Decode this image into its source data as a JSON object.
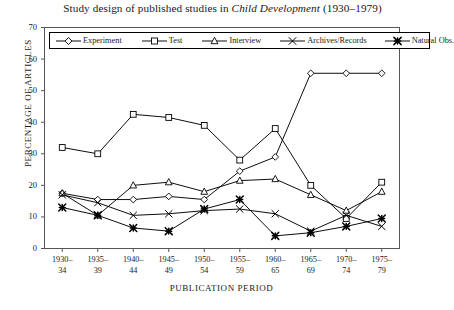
{
  "title": {
    "pre": "Study design of published studies in ",
    "italic": "Child Development",
    "post": " (1930–1979)"
  },
  "axes": {
    "ylabel": "PERCENTAGE OF ARTICLES",
    "xlabel": "PUBLICATION PERIOD",
    "yticks": [
      "0",
      "10",
      "20",
      "30",
      "40",
      "50",
      "60",
      "70"
    ],
    "ymin": 0,
    "ymax": 70,
    "grid": false
  },
  "legend": {
    "position": "top-inside",
    "items": [
      {
        "label": "Experiment",
        "marker": "diamond"
      },
      {
        "label": "Test",
        "marker": "square"
      },
      {
        "label": "Interview",
        "marker": "triangle"
      },
      {
        "label": "Archives/Records",
        "marker": "x-cross"
      },
      {
        "label": "Natural Obs.",
        "marker": "asterisk-bold"
      }
    ]
  },
  "chart_data": {
    "type": "line",
    "title": "Study design of published studies in Child Development (1930–1979)",
    "xlabel": "PUBLICATION PERIOD",
    "ylabel": "PERCENTAGE OF ARTICLES",
    "ylim": [
      0,
      70
    ],
    "yticks": [
      0,
      10,
      20,
      30,
      40,
      50,
      60,
      70
    ],
    "grid": false,
    "legend_position": "top-inside",
    "categories": [
      "1930–34",
      "1935–39",
      "1940–44",
      "1945–49",
      "1950–54",
      "1955–59",
      "1960–65",
      "1965–69",
      "1970–74",
      "1975–79"
    ],
    "categories_split": [
      [
        "1930–",
        "34"
      ],
      [
        "1935–",
        "39"
      ],
      [
        "1940–",
        "44"
      ],
      [
        "1945–",
        "49"
      ],
      [
        "1950–",
        "54"
      ],
      [
        "1955–",
        "59"
      ],
      [
        "1960–",
        "65"
      ],
      [
        "1965–",
        "69"
      ],
      [
        "1970–",
        "74"
      ],
      [
        "1975–",
        "79"
      ]
    ],
    "series": [
      {
        "name": "Experiment",
        "marker": "diamond",
        "values": [
          17.5,
          15.5,
          15.5,
          16.5,
          15.5,
          24.5,
          29.0,
          55.5,
          55.5,
          55.5
        ]
      },
      {
        "name": "Test",
        "marker": "square",
        "values": [
          32.0,
          30.0,
          42.5,
          41.5,
          39.0,
          28.0,
          38.0,
          20.0,
          9.5,
          21.0
        ]
      },
      {
        "name": "Interview",
        "marker": "triangle",
        "values": [
          17.5,
          10.5,
          20.0,
          21.0,
          18.0,
          21.5,
          22.0,
          17.0,
          12.0,
          18.0
        ]
      },
      {
        "name": "Archives/Records",
        "marker": "x-cross",
        "values": [
          17.0,
          14.5,
          10.5,
          11.0,
          12.0,
          12.5,
          11.0,
          5.5,
          10.5,
          7.0
        ]
      },
      {
        "name": "Natural Obs.",
        "marker": "asterisk-bold",
        "values": [
          13.0,
          10.5,
          6.5,
          5.5,
          12.5,
          15.5,
          4.0,
          5.0,
          7.0,
          9.5
        ]
      }
    ]
  }
}
